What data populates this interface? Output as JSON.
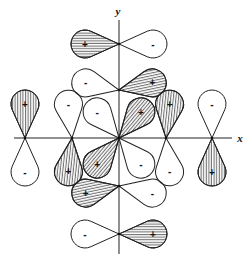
{
  "axes": {
    "x_label": "x",
    "y_label": "y"
  },
  "colors": {
    "line": "#222222",
    "hatch": "#333333",
    "background": "#ffffff"
  },
  "orbitals": [
    {
      "name": "top",
      "node": [
        119,
        44
      ],
      "lobes": [
        {
          "angle": 180,
          "sign": "+"
        },
        {
          "angle": 0,
          "sign": "-"
        }
      ]
    },
    {
      "name": "bottom",
      "node": [
        119,
        234
      ],
      "lobes": [
        {
          "angle": 180,
          "sign": "-"
        },
        {
          "angle": 0,
          "sign": "+"
        }
      ]
    },
    {
      "name": "left",
      "node": [
        25,
        138
      ],
      "lobes": [
        {
          "angle": -90,
          "sign": "+"
        },
        {
          "angle": 90,
          "sign": "-"
        }
      ]
    },
    {
      "name": "right",
      "node": [
        212,
        138
      ],
      "lobes": [
        {
          "angle": -90,
          "sign": "-"
        },
        {
          "angle": 90,
          "sign": "+"
        }
      ]
    },
    {
      "name": "inner-top",
      "node": [
        119,
        90
      ],
      "lobes": [
        {
          "angle": 192,
          "sign": "-"
        },
        {
          "angle": -12,
          "sign": "+"
        }
      ]
    },
    {
      "name": "inner-bottom",
      "node": [
        119,
        186
      ],
      "lobes": [
        {
          "angle": 168,
          "sign": "+"
        },
        {
          "angle": 12,
          "sign": "-"
        }
      ]
    },
    {
      "name": "inner-left",
      "node": [
        72,
        138
      ],
      "lobes": [
        {
          "angle": -96,
          "sign": "-"
        },
        {
          "angle": 96,
          "sign": "+"
        }
      ]
    },
    {
      "name": "inner-right",
      "node": [
        166,
        138
      ],
      "lobes": [
        {
          "angle": -84,
          "sign": "+"
        },
        {
          "angle": 84,
          "sign": "-"
        }
      ]
    },
    {
      "name": "center-diagonal",
      "node": [
        119,
        138
      ],
      "lobes": [
        {
          "angle": -130,
          "sign": "-"
        },
        {
          "angle": -50,
          "sign": "+"
        },
        {
          "angle": 130,
          "sign": "+"
        },
        {
          "angle": 50,
          "sign": "-"
        }
      ]
    }
  ],
  "signs": {
    "plus": "+",
    "minus": "-"
  }
}
